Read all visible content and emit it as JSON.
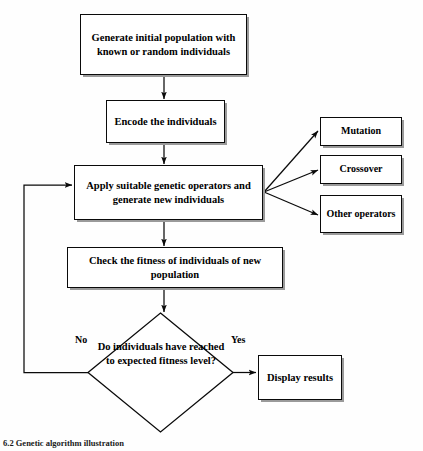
{
  "figure": {
    "type": "flowchart",
    "caption": "6.2 Genetic algorithm illustration",
    "colors": {
      "background": "#fefefe",
      "stroke": "#0a0a0a",
      "fill": "#ffffff",
      "shadow": "#9a9a9a",
      "text": "#000000"
    }
  },
  "nodes": {
    "init": {
      "shape": "process",
      "label": "Generate initial population with known or random individuals"
    },
    "encode": {
      "shape": "process",
      "label": "Encode the individuals"
    },
    "apply": {
      "shape": "process",
      "label": "Apply suitable genetic operators and generate new individuals"
    },
    "check": {
      "shape": "process",
      "label": "Check the fitness of individuals of new population"
    },
    "mutation": {
      "shape": "process",
      "label": "Mutation"
    },
    "crossover": {
      "shape": "process",
      "label": "Crossover"
    },
    "other": {
      "shape": "process",
      "label": "Other operators"
    },
    "decision": {
      "shape": "diamond",
      "label": "Do individuals have reached to expected fitness level?"
    },
    "display": {
      "shape": "process",
      "label": "Display results"
    }
  },
  "edges": {
    "no_label": "No",
    "yes_label": "Yes",
    "connections": [
      {
        "from": "init",
        "to": "encode",
        "label": ""
      },
      {
        "from": "encode",
        "to": "apply",
        "label": ""
      },
      {
        "from": "apply",
        "to": "mutation",
        "label": ""
      },
      {
        "from": "apply",
        "to": "crossover",
        "label": ""
      },
      {
        "from": "apply",
        "to": "other",
        "label": ""
      },
      {
        "from": "apply",
        "to": "check",
        "label": ""
      },
      {
        "from": "check",
        "to": "decision",
        "label": ""
      },
      {
        "from": "decision",
        "to": "display",
        "label": "Yes"
      },
      {
        "from": "decision",
        "to": "apply",
        "label": "No"
      }
    ]
  }
}
